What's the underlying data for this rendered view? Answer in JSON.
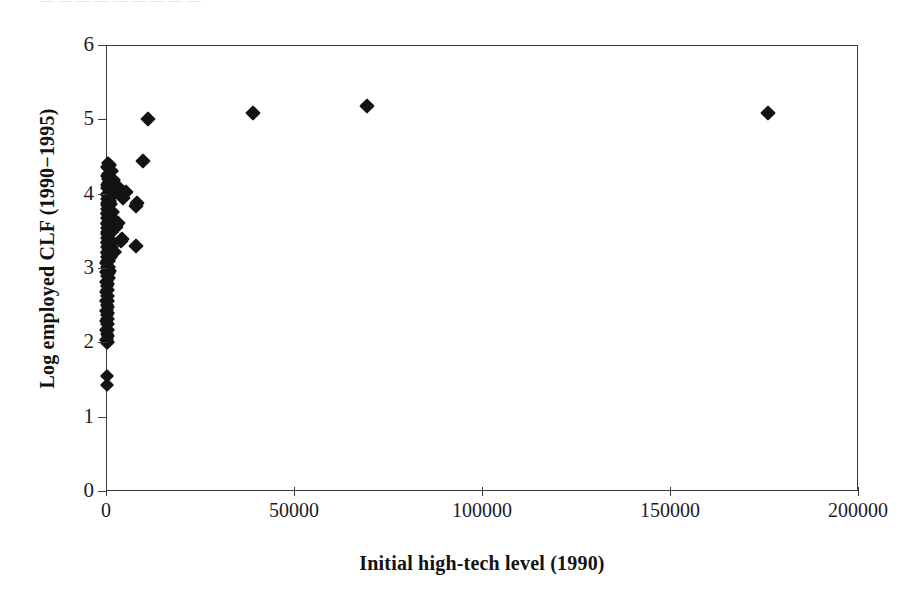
{
  "figure": {
    "top_artifact_text": "— — — — — — — — —",
    "background_color": "#ffffff",
    "axis_color": "#3a3a3c",
    "marker_color": "#131315"
  },
  "chart_data": {
    "type": "scatter",
    "title": "",
    "xlabel": "Initial high-tech level (1990)",
    "ylabel": "Log employed CLF (1990−1995)",
    "xlim": [
      0,
      200000
    ],
    "ylim": [
      0,
      6
    ],
    "xticks": [
      0,
      50000,
      100000,
      150000,
      200000
    ],
    "xtick_labels": [
      "0",
      "50000",
      "100000",
      "150000",
      "200000"
    ],
    "yticks": [
      0,
      1,
      2,
      3,
      4,
      5,
      6
    ],
    "ytick_labels": [
      "0",
      "1",
      "2",
      "3",
      "4",
      "5",
      "6"
    ],
    "grid": false,
    "legend": null,
    "marker": "diamond",
    "series": [
      {
        "name": "Metropolitan areas",
        "points": [
          [
            176000,
            5.09
          ],
          [
            69500,
            5.18
          ],
          [
            39000,
            5.08
          ],
          [
            11200,
            5.01
          ],
          [
            9800,
            4.44
          ],
          [
            8200,
            3.88
          ],
          [
            8000,
            3.84
          ],
          [
            7900,
            3.3
          ],
          [
            5200,
            4.02
          ],
          [
            4600,
            3.94
          ],
          [
            4300,
            3.39
          ],
          [
            3900,
            3.36
          ],
          [
            3400,
            4.08
          ],
          [
            3100,
            3.61
          ],
          [
            2700,
            3.55
          ],
          [
            2400,
            3.21
          ],
          [
            2100,
            4.18
          ],
          [
            1950,
            3.98
          ],
          [
            1800,
            3.76
          ],
          [
            1700,
            3.49
          ],
          [
            1600,
            3.28
          ],
          [
            1500,
            4.3
          ],
          [
            1450,
            4.05
          ],
          [
            1400,
            3.86
          ],
          [
            1350,
            3.7
          ],
          [
            1300,
            3.52
          ],
          [
            1250,
            3.33
          ],
          [
            1200,
            3.15
          ],
          [
            1150,
            2.96
          ],
          [
            1100,
            4.38
          ],
          [
            1050,
            4.22
          ],
          [
            1000,
            4.12
          ],
          [
            980,
            3.99
          ],
          [
            950,
            3.9
          ],
          [
            920,
            3.8
          ],
          [
            900,
            3.72
          ],
          [
            880,
            3.64
          ],
          [
            860,
            3.56
          ],
          [
            840,
            3.47
          ],
          [
            820,
            3.4
          ],
          [
            800,
            3.32
          ],
          [
            780,
            3.24
          ],
          [
            760,
            3.17
          ],
          [
            740,
            3.09
          ],
          [
            720,
            3.01
          ],
          [
            700,
            2.93
          ],
          [
            680,
            2.86
          ],
          [
            660,
            2.78
          ],
          [
            640,
            2.7
          ],
          [
            620,
            2.62
          ],
          [
            600,
            2.55
          ],
          [
            580,
            2.47
          ],
          [
            560,
            2.39
          ],
          [
            540,
            2.32
          ],
          [
            520,
            2.24
          ],
          [
            500,
            2.16
          ],
          [
            480,
            2.08
          ],
          [
            460,
            2.01
          ],
          [
            440,
            4.41
          ],
          [
            430,
            4.34
          ],
          [
            420,
            4.27
          ],
          [
            410,
            4.2
          ],
          [
            400,
            4.14
          ],
          [
            390,
            4.07
          ],
          [
            380,
            4.0
          ],
          [
            370,
            3.93
          ],
          [
            360,
            3.87
          ],
          [
            350,
            3.8
          ],
          [
            340,
            3.74
          ],
          [
            330,
            3.67
          ],
          [
            320,
            3.61
          ],
          [
            310,
            3.54
          ],
          [
            300,
            3.48
          ],
          [
            295,
            3.41
          ],
          [
            290,
            3.35
          ],
          [
            285,
            3.28
          ],
          [
            280,
            3.22
          ],
          [
            275,
            3.15
          ],
          [
            270,
            3.09
          ],
          [
            265,
            3.02
          ],
          [
            260,
            2.96
          ],
          [
            255,
            2.89
          ],
          [
            250,
            2.83
          ],
          [
            245,
            2.76
          ],
          [
            240,
            2.7
          ],
          [
            235,
            2.63
          ],
          [
            230,
            2.57
          ],
          [
            225,
            2.5
          ],
          [
            220,
            2.44
          ],
          [
            215,
            2.37
          ],
          [
            210,
            2.31
          ],
          [
            205,
            2.24
          ],
          [
            200,
            2.18
          ],
          [
            195,
            2.11
          ],
          [
            190,
            2.05
          ],
          [
            185,
            1.99
          ],
          [
            180,
            4.36
          ],
          [
            175,
            4.24
          ],
          [
            170,
            4.11
          ],
          [
            165,
            3.98
          ],
          [
            160,
            3.85
          ],
          [
            155,
            3.72
          ],
          [
            150,
            3.59
          ],
          [
            145,
            3.46
          ],
          [
            140,
            3.33
          ],
          [
            135,
            3.2
          ],
          [
            130,
            3.07
          ],
          [
            125,
            2.94
          ],
          [
            120,
            2.81
          ],
          [
            115,
            2.68
          ],
          [
            110,
            2.55
          ],
          [
            105,
            2.42
          ],
          [
            100,
            2.29
          ],
          [
            95,
            2.16
          ],
          [
            90,
            2.03
          ],
          [
            300,
            1.55
          ],
          [
            280,
            1.42
          ]
        ]
      }
    ]
  }
}
